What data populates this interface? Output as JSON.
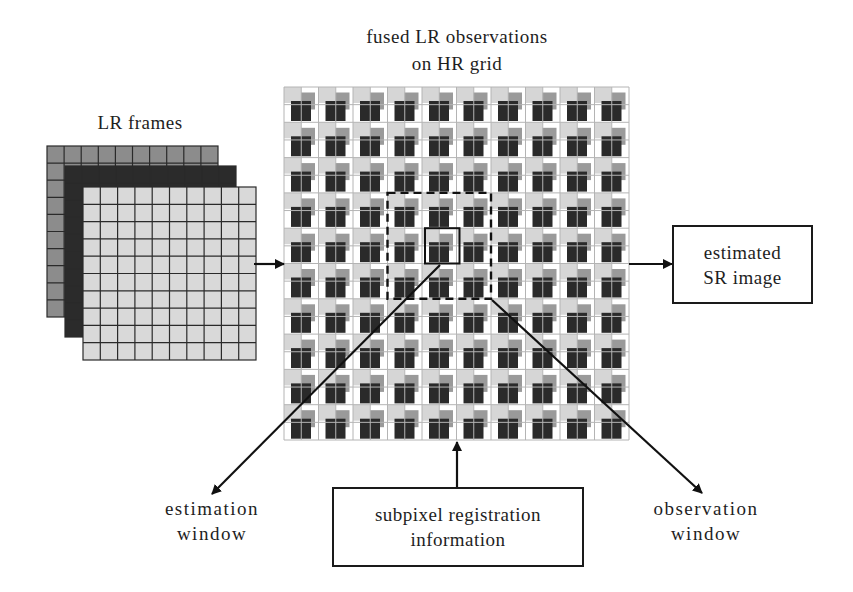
{
  "diagram": {
    "title": {
      "line1": "fused LR observations",
      "line2": "on HR grid"
    },
    "lr_frames": {
      "label": "LR frames",
      "frames": [
        {
          "name": "frame-1",
          "fill": "#8c8c8c",
          "x": 47,
          "y": 146,
          "cols": 10,
          "rows": 10,
          "cell": 17.1
        },
        {
          "name": "frame-2",
          "fill": "#2b2b2b",
          "x": 65,
          "y": 166,
          "cols": 10,
          "rows": 10,
          "cell": 17.1
        },
        {
          "name": "frame-3",
          "fill": "#d9d9d9",
          "x": 83,
          "y": 187,
          "cols": 10,
          "rows": 10,
          "cell": 17.3
        }
      ],
      "grid_line_color": "#2a2a2a"
    },
    "hr_grid": {
      "x": 284,
      "y": 87,
      "cols": 10,
      "rows": 10,
      "cell_w": 34.5,
      "cell_h": 35.3,
      "grid_line_color": "#b4b4b4",
      "light_color": "#d6d6d6",
      "medium_color": "#9a9a9a",
      "dark_color": "#2a2a2a"
    },
    "observation_window": {
      "label_line1": "observation",
      "label_line2": "window",
      "col": 3,
      "row": 3,
      "span": 3,
      "style": "dashed"
    },
    "estimation_window": {
      "label_line1": "estimation",
      "label_line2": "window",
      "col": 4,
      "row": 4,
      "span": 1,
      "style": "solid"
    },
    "output_box": {
      "line1": "estimated",
      "line2": "SR image"
    },
    "registration_box": {
      "line1": "subpixel registration",
      "line2": "information"
    },
    "arrows": [
      {
        "name": "lr-to-grid-arrow",
        "from": [
          254,
          264
        ],
        "to": [
          284,
          264
        ]
      },
      {
        "name": "grid-to-sr-arrow",
        "from": [
          629,
          264
        ],
        "to": [
          672,
          264
        ]
      },
      {
        "name": "registration-to-grid-arrow",
        "from": [
          457,
          487
        ],
        "to": [
          457,
          442
        ]
      },
      {
        "name": "estimation-window-arrow",
        "from": [
          440,
          265
        ],
        "to": [
          212,
          494
        ]
      },
      {
        "name": "observation-window-arrow",
        "from": [
          492,
          300
        ],
        "to": [
          702,
          493
        ]
      }
    ]
  }
}
